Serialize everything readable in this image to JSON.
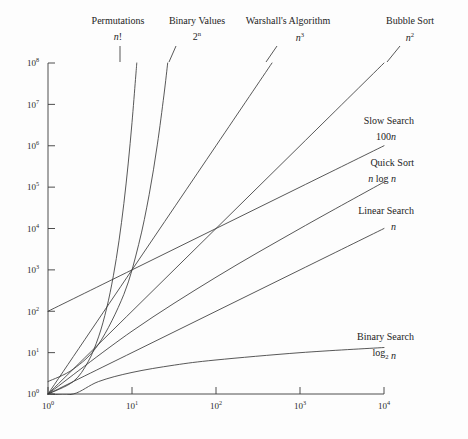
{
  "chart_data": {
    "type": "line",
    "title": "",
    "subtitle": "",
    "xlabel": "",
    "ylabel": "",
    "xscale": "log",
    "yscale": "log",
    "xlim": [
      1,
      10000
    ],
    "ylim": [
      1,
      100000000
    ],
    "grid": false,
    "legend_position": "inline-annotations",
    "x_ticks": [
      {
        "value": 1,
        "mantissa": "10",
        "exponent": "0"
      },
      {
        "value": 10,
        "mantissa": "10",
        "exponent": "1"
      },
      {
        "value": 100,
        "mantissa": "10",
        "exponent": "2"
      },
      {
        "value": 1000,
        "mantissa": "10",
        "exponent": "3"
      },
      {
        "value": 10000,
        "mantissa": "10",
        "exponent": "4"
      }
    ],
    "y_ticks": [
      {
        "value": 1,
        "mantissa": "10",
        "exponent": "0"
      },
      {
        "value": 10,
        "mantissa": "10",
        "exponent": "1"
      },
      {
        "value": 100,
        "mantissa": "10",
        "exponent": "2"
      },
      {
        "value": 1000,
        "mantissa": "10",
        "exponent": "3"
      },
      {
        "value": 10000,
        "mantissa": "10",
        "exponent": "4"
      },
      {
        "value": 100000,
        "mantissa": "10",
        "exponent": "5"
      },
      {
        "value": 1000000,
        "mantissa": "10",
        "exponent": "6"
      },
      {
        "value": 10000000,
        "mantissa": "10",
        "exponent": "7"
      },
      {
        "value": 100000000,
        "mantissa": "10",
        "exponent": "8"
      }
    ],
    "series": [
      {
        "name": "Permutations",
        "formula_plain": "n!",
        "formula_parts": [
          {
            "t": "n",
            "style": "italic"
          },
          {
            "t": "!",
            "style": "roman"
          }
        ],
        "label_anchor": "top",
        "points": [
          {
            "x": 1,
            "y": 1
          },
          {
            "x": 2,
            "y": 2
          },
          {
            "x": 3,
            "y": 6
          },
          {
            "x": 4,
            "y": 24
          },
          {
            "x": 5,
            "y": 120
          },
          {
            "x": 6,
            "y": 720
          },
          {
            "x": 7,
            "y": 5040
          },
          {
            "x": 8,
            "y": 40320
          },
          {
            "x": 9,
            "y": 362880
          },
          {
            "x": 10,
            "y": 3628800
          },
          {
            "x": 11,
            "y": 39916800
          },
          {
            "x": 11.4,
            "y": 100000000
          }
        ]
      },
      {
        "name": "Binary Values",
        "formula_plain": "2^n",
        "formula_parts": [
          {
            "t": "2",
            "style": "roman"
          },
          {
            "t": "n",
            "style": "sup-italic"
          }
        ],
        "label_anchor": "top",
        "points": [
          {
            "x": 1,
            "y": 2
          },
          {
            "x": 2,
            "y": 4
          },
          {
            "x": 4,
            "y": 16
          },
          {
            "x": 8,
            "y": 256
          },
          {
            "x": 12,
            "y": 4096
          },
          {
            "x": 16,
            "y": 65536
          },
          {
            "x": 20,
            "y": 1048576
          },
          {
            "x": 24,
            "y": 16777216
          },
          {
            "x": 26.6,
            "y": 100000000
          }
        ]
      },
      {
        "name": "Warshall's Algorithm",
        "formula_plain": "n^3",
        "formula_parts": [
          {
            "t": "n",
            "style": "italic"
          },
          {
            "t": "3",
            "style": "sup"
          }
        ],
        "label_anchor": "top",
        "points": [
          {
            "x": 1,
            "y": 1
          },
          {
            "x": 10,
            "y": 1000
          },
          {
            "x": 100,
            "y": 1000000
          },
          {
            "x": 464,
            "y": 100000000
          }
        ]
      },
      {
        "name": "Bubble Sort",
        "formula_plain": "n^2",
        "formula_parts": [
          {
            "t": "n",
            "style": "italic"
          },
          {
            "t": "2",
            "style": "sup"
          }
        ],
        "label_anchor": "top",
        "points": [
          {
            "x": 1,
            "y": 1
          },
          {
            "x": 10,
            "y": 100
          },
          {
            "x": 100,
            "y": 10000
          },
          {
            "x": 1000,
            "y": 1000000
          },
          {
            "x": 10000,
            "y": 100000000
          }
        ]
      },
      {
        "name": "Slow Search",
        "formula_plain": "100n",
        "formula_parts": [
          {
            "t": "100",
            "style": "roman"
          },
          {
            "t": "n",
            "style": "italic"
          }
        ],
        "label_anchor": "right",
        "points": [
          {
            "x": 1,
            "y": 100
          },
          {
            "x": 10,
            "y": 1000
          },
          {
            "x": 100,
            "y": 10000
          },
          {
            "x": 1000,
            "y": 100000
          },
          {
            "x": 10000,
            "y": 1000000
          }
        ]
      },
      {
        "name": "Quick Sort",
        "formula_plain": "n log n",
        "formula_parts": [
          {
            "t": "n",
            "style": "italic"
          },
          {
            "t": " log ",
            "style": "roman"
          },
          {
            "t": "n",
            "style": "italic"
          }
        ],
        "label_anchor": "right",
        "points": [
          {
            "x": 1,
            "y": 1
          },
          {
            "x": 10,
            "y": 33
          },
          {
            "x": 100,
            "y": 664
          },
          {
            "x": 1000,
            "y": 9966
          },
          {
            "x": 10000,
            "y": 132877
          }
        ]
      },
      {
        "name": "Linear Search",
        "formula_plain": "n",
        "formula_parts": [
          {
            "t": "n",
            "style": "italic"
          }
        ],
        "label_anchor": "right",
        "points": [
          {
            "x": 1,
            "y": 1
          },
          {
            "x": 10,
            "y": 10
          },
          {
            "x": 100,
            "y": 100
          },
          {
            "x": 1000,
            "y": 1000
          },
          {
            "x": 10000,
            "y": 10000
          }
        ]
      },
      {
        "name": "Binary Search",
        "formula_plain": "log2 n",
        "formula_parts": [
          {
            "t": "log",
            "style": "roman"
          },
          {
            "t": "2",
            "style": "sub"
          },
          {
            "t": " n",
            "style": "italic"
          }
        ],
        "label_anchor": "right",
        "points": [
          {
            "x": 1,
            "y": 1
          },
          {
            "x": 2,
            "y": 1
          },
          {
            "x": 4,
            "y": 2
          },
          {
            "x": 10,
            "y": 3.32
          },
          {
            "x": 32,
            "y": 5
          },
          {
            "x": 100,
            "y": 6.64
          },
          {
            "x": 1000,
            "y": 9.97
          },
          {
            "x": 10000,
            "y": 13.29
          }
        ]
      }
    ],
    "annotations": [
      {
        "name": "Permutations",
        "label": "Permutations",
        "formula": "n!",
        "x": 118,
        "y": 24,
        "formula_x": 118,
        "formula_y": 40
      },
      {
        "name": "Binary Values",
        "label": "Binary Values",
        "formula": "2ⁿ",
        "x": 197,
        "y": 24,
        "formula_x": 197,
        "formula_y": 40
      },
      {
        "name": "Warshall's Algorithm",
        "label": "Warshall's Algorithm",
        "formula": "n³",
        "x": 288,
        "y": 24,
        "formula_x": 300,
        "formula_y": 41
      },
      {
        "name": "Bubble Sort",
        "label": "Bubble Sort",
        "formula": "n²",
        "x": 410,
        "y": 24,
        "formula_x": 410,
        "formula_y": 41
      },
      {
        "name": "Slow Search",
        "label": "Slow Search",
        "formula": "100n",
        "x": 414,
        "y": 124,
        "formula_x": 414,
        "formula_y": 140
      },
      {
        "name": "Quick Sort",
        "label": "Quick Sort",
        "formula": "n log n",
        "x": 414,
        "y": 166,
        "formula_x": 414,
        "formula_y": 182
      },
      {
        "name": "Linear Search",
        "label": "Linear Search",
        "formula": "n",
        "x": 414,
        "y": 214,
        "formula_x": 414,
        "formula_y": 230
      },
      {
        "name": "Binary Search",
        "label": "Binary Search",
        "formula": "log₂ n",
        "x": 414,
        "y": 340,
        "formula_x": 414,
        "formula_y": 356
      }
    ],
    "colors": {
      "background": "#fdfdfd",
      "axis": "#3a3a3a",
      "curve": "#3a3a3a",
      "text": "#2b2b2b"
    }
  },
  "plot_geometry": {
    "left": 48,
    "right": 384,
    "top": 63,
    "bottom": 394
  }
}
